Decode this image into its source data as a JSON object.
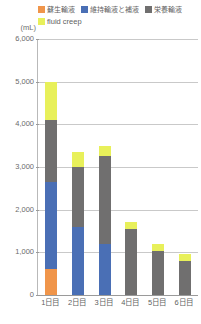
{
  "chart_data": {
    "type": "bar",
    "stacked": true,
    "title": "",
    "xlabel": "",
    "ylabel": "(mL)",
    "unit": "(mL)",
    "ylim": [
      0,
      6000
    ],
    "ytick_values": [
      6000,
      5000,
      4000,
      3000,
      2000,
      1000,
      0
    ],
    "ytick_labels": [
      "6,000",
      "5,000",
      "4,000",
      "3,000",
      "2,000",
      "1,000",
      "0"
    ],
    "grid": true,
    "legend_position": "top",
    "categories": [
      "1日目",
      "2日目",
      "3日目",
      "4日目",
      "5日目",
      "6日目"
    ],
    "series": [
      {
        "name": "蘇生輸液",
        "color": "#F0954A",
        "values": [
          600,
          0,
          0,
          0,
          0,
          0
        ]
      },
      {
        "name": "維持輸液と補液",
        "color": "#4A6FB5",
        "values": [
          2050,
          1600,
          1200,
          0,
          0,
          0
        ]
      },
      {
        "name": "栄養輸液",
        "color": "#706F6F",
        "values": [
          1450,
          1400,
          2050,
          1550,
          1020,
          800
        ]
      },
      {
        "name": "fluid creep",
        "color": "#E8F05A",
        "values": [
          900,
          350,
          250,
          150,
          180,
          150
        ]
      }
    ],
    "totals": [
      5000,
      3350,
      3500,
      1700,
      1200,
      950
    ]
  }
}
